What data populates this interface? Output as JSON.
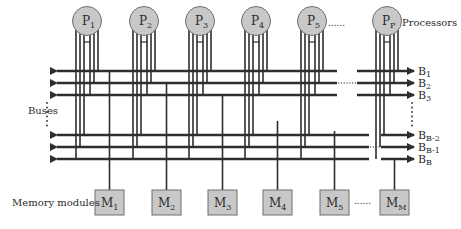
{
  "diagram": {
    "colors": {
      "line": "#2e2e2e",
      "node_fill": "#c8c8c8",
      "node_stroke": "#6e6e6e",
      "text": "#2b2b2b",
      "background": "#ffffff"
    },
    "labels": {
      "processors": "Processors",
      "buses": "Buses",
      "memory_modules": "Memory modules",
      "processor_ellipsis": "......",
      "memory_ellipsis": "......"
    },
    "processors": [
      {
        "id": "P1",
        "base": "P",
        "sub": "1",
        "cx": 87
      },
      {
        "id": "P2",
        "base": "P",
        "sub": "2",
        "cx": 144
      },
      {
        "id": "P3",
        "base": "P",
        "sub": "3",
        "cx": 200
      },
      {
        "id": "P4",
        "base": "P",
        "sub": "4",
        "cx": 256
      },
      {
        "id": "P5",
        "base": "P",
        "sub": "5",
        "cx": 312
      },
      {
        "id": "Pp",
        "base": "P",
        "sub": "P",
        "cx": 387
      }
    ],
    "buses": [
      {
        "id": "B1",
        "base": "B",
        "sub": "1",
        "y": 71
      },
      {
        "id": "B2",
        "base": "B",
        "sub": "2",
        "y": 83
      },
      {
        "id": "B3",
        "base": "B",
        "sub": "3",
        "y": 95
      },
      {
        "id": "BB-2",
        "base": "B",
        "sub": "B-2",
        "y": 135
      },
      {
        "id": "BB-1",
        "base": "B",
        "sub": "B-1",
        "y": 147
      },
      {
        "id": "BB",
        "base": "B",
        "sub": "B",
        "y": 159
      }
    ],
    "memory_modules": [
      {
        "id": "M1",
        "base": "M",
        "sub": "1",
        "x": 95,
        "tap_bus": 0
      },
      {
        "id": "M2",
        "base": "M",
        "sub": "2",
        "x": 152,
        "tap_bus": 1
      },
      {
        "id": "M3",
        "base": "M",
        "sub": "3",
        "x": 208,
        "tap_bus": 2
      },
      {
        "id": "M4",
        "base": "M",
        "sub": "4",
        "x": 263,
        "tap_bus": 3
      },
      {
        "id": "M5",
        "base": "M",
        "sub": "5",
        "x": 320,
        "tap_bus": 4
      },
      {
        "id": "MM",
        "base": "M",
        "sub": "M",
        "x": 380,
        "tap_bus": 5
      }
    ]
  }
}
